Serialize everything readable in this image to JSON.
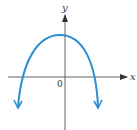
{
  "graph": {
    "x_axis_label": "x",
    "y_axis_label": "y",
    "origin_label": "0",
    "curve_color": "#2b8ed2",
    "axis_color": "#555555",
    "curve_description": "downward-opening parabola, vertex slightly left of y-axis above x-axis, both ends pointing down with arrows"
  }
}
